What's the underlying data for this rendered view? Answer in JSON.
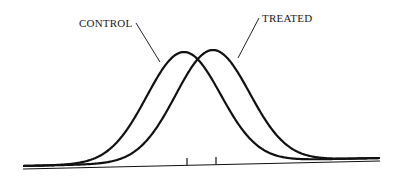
{
  "chart_data": {
    "type": "line",
    "title": "",
    "xlabel": "",
    "ylabel": "",
    "grid": false,
    "legend": "inline annotations with leader lines",
    "series": [
      {
        "name": "CONTROL",
        "shape": "normal",
        "mean_x": 0,
        "sd": 1,
        "peak_height": 1.0
      },
      {
        "name": "TREATED",
        "shape": "normal",
        "mean_x": 0.5,
        "sd": 1,
        "peak_height": 1.0
      }
    ],
    "x_ticks": [
      {
        "label": "",
        "at": "control mean"
      },
      {
        "label": "",
        "at": "treated mean"
      }
    ],
    "annotations": [
      "CONTROL",
      "TREATED"
    ]
  },
  "labels": {
    "control": "CONTROL",
    "treated": "TREATED"
  }
}
